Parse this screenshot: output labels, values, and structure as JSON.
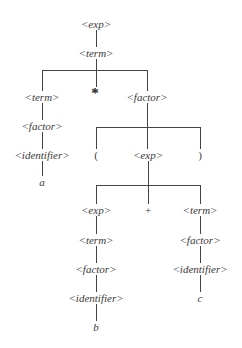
{
  "diagram": {
    "type": "parse-tree",
    "line_color": "#444444",
    "text_color": "#3a3a3a",
    "nodes": [
      {
        "id": "n0",
        "label": "<exp>",
        "x": 96,
        "y": 24,
        "kind": "nonterminal"
      },
      {
        "id": "n1",
        "label": "<term>",
        "x": 96,
        "y": 53,
        "kind": "nonterminal"
      },
      {
        "id": "n2",
        "label": "<term>",
        "x": 42,
        "y": 97,
        "kind": "nonterminal"
      },
      {
        "id": "n3",
        "label": "*",
        "x": 95,
        "y": 93,
        "kind": "operator"
      },
      {
        "id": "n4",
        "label": "<factor>",
        "x": 147,
        "y": 97,
        "kind": "nonterminal"
      },
      {
        "id": "n5",
        "label": "<factor>",
        "x": 42,
        "y": 126,
        "kind": "nonterminal"
      },
      {
        "id": "n6",
        "label": "<identifier>",
        "x": 42,
        "y": 155,
        "kind": "nonterminal"
      },
      {
        "id": "n7",
        "label": "a",
        "x": 42,
        "y": 182,
        "kind": "terminal"
      },
      {
        "id": "n8",
        "label": "(",
        "x": 96,
        "y": 155,
        "kind": "symbol"
      },
      {
        "id": "n9",
        "label": "<exp>",
        "x": 148,
        "y": 155,
        "kind": "nonterminal"
      },
      {
        "id": "n10",
        "label": ")",
        "x": 200,
        "y": 155,
        "kind": "symbol"
      },
      {
        "id": "n11",
        "label": "<exp>",
        "x": 96,
        "y": 210,
        "kind": "nonterminal"
      },
      {
        "id": "n12",
        "label": "+",
        "x": 148,
        "y": 210,
        "kind": "symbol"
      },
      {
        "id": "n13",
        "label": "<term>",
        "x": 200,
        "y": 210,
        "kind": "nonterminal"
      },
      {
        "id": "n14",
        "label": "<term>",
        "x": 96,
        "y": 240,
        "kind": "nonterminal"
      },
      {
        "id": "n15",
        "label": "<factor>",
        "x": 96,
        "y": 269,
        "kind": "nonterminal"
      },
      {
        "id": "n16",
        "label": "<identifier>",
        "x": 96,
        "y": 298,
        "kind": "nonterminal"
      },
      {
        "id": "n17",
        "label": "b",
        "x": 96,
        "y": 327,
        "kind": "terminal"
      },
      {
        "id": "n18",
        "label": "<factor>",
        "x": 200,
        "y": 240,
        "kind": "nonterminal"
      },
      {
        "id": "n19",
        "label": "<identifier>",
        "x": 200,
        "y": 269,
        "kind": "nonterminal"
      },
      {
        "id": "n20",
        "label": "c",
        "x": 200,
        "y": 298,
        "kind": "terminal"
      }
    ],
    "edges": [
      {
        "from": "n0",
        "to": "n1"
      },
      {
        "from": "n1",
        "to": "n2"
      },
      {
        "from": "n1",
        "to": "n3"
      },
      {
        "from": "n1",
        "to": "n4"
      },
      {
        "from": "n2",
        "to": "n5"
      },
      {
        "from": "n5",
        "to": "n6"
      },
      {
        "from": "n6",
        "to": "n7"
      },
      {
        "from": "n4",
        "to": "n8"
      },
      {
        "from": "n4",
        "to": "n9"
      },
      {
        "from": "n4",
        "to": "n10"
      },
      {
        "from": "n9",
        "to": "n11"
      },
      {
        "from": "n9",
        "to": "n12"
      },
      {
        "from": "n9",
        "to": "n13"
      },
      {
        "from": "n11",
        "to": "n14"
      },
      {
        "from": "n14",
        "to": "n15"
      },
      {
        "from": "n15",
        "to": "n16"
      },
      {
        "from": "n16",
        "to": "n17"
      },
      {
        "from": "n13",
        "to": "n18"
      },
      {
        "from": "n18",
        "to": "n19"
      },
      {
        "from": "n19",
        "to": "n20"
      }
    ],
    "line_segments": [
      {
        "type": "v",
        "x": 96,
        "y1": 30,
        "y2": 47
      },
      {
        "type": "v",
        "x": 96,
        "y1": 59,
        "y2": 88
      },
      {
        "type": "h",
        "y": 70,
        "x1": 42,
        "x2": 147
      },
      {
        "type": "v",
        "x": 42,
        "y1": 70,
        "y2": 91
      },
      {
        "type": "v",
        "x": 147,
        "y1": 70,
        "y2": 91
      },
      {
        "type": "v",
        "x": 42,
        "y1": 103,
        "y2": 120
      },
      {
        "type": "v",
        "x": 42,
        "y1": 132,
        "y2": 149
      },
      {
        "type": "v",
        "x": 42,
        "y1": 161,
        "y2": 176
      },
      {
        "type": "v",
        "x": 147,
        "y1": 103,
        "y2": 149
      },
      {
        "type": "h",
        "y": 127,
        "x1": 96,
        "x2": 200
      },
      {
        "type": "v",
        "x": 96,
        "y1": 127,
        "y2": 149
      },
      {
        "type": "v",
        "x": 200,
        "y1": 127,
        "y2": 149
      },
      {
        "type": "v",
        "x": 148,
        "y1": 161,
        "y2": 204
      },
      {
        "type": "h",
        "y": 185,
        "x1": 96,
        "x2": 200
      },
      {
        "type": "v",
        "x": 96,
        "y1": 185,
        "y2": 204
      },
      {
        "type": "v",
        "x": 200,
        "y1": 185,
        "y2": 204
      },
      {
        "type": "v",
        "x": 96,
        "y1": 216,
        "y2": 234
      },
      {
        "type": "v",
        "x": 96,
        "y1": 246,
        "y2": 263
      },
      {
        "type": "v",
        "x": 96,
        "y1": 275,
        "y2": 292
      },
      {
        "type": "v",
        "x": 96,
        "y1": 304,
        "y2": 321
      },
      {
        "type": "v",
        "x": 200,
        "y1": 216,
        "y2": 234
      },
      {
        "type": "v",
        "x": 200,
        "y1": 246,
        "y2": 263
      },
      {
        "type": "v",
        "x": 200,
        "y1": 275,
        "y2": 292
      }
    ]
  }
}
